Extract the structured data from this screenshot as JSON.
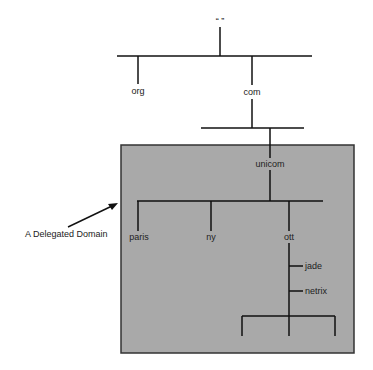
{
  "diagram": {
    "type": "dns-tree",
    "root": {
      "label": "“ ”"
    },
    "top_level": [
      {
        "label": "org"
      },
      {
        "label": "com"
      }
    ],
    "com_children": [
      {
        "label": "unicom"
      }
    ],
    "unicom_children": [
      {
        "label": "paris"
      },
      {
        "label": "ny"
      },
      {
        "label": "ott"
      }
    ],
    "ott_children": [
      {
        "label": "jade"
      },
      {
        "label": "netrix"
      }
    ],
    "delegated_zone": {
      "label": "A Delegated Domain",
      "fill": "#a9a9a9",
      "border": "#333333"
    }
  }
}
